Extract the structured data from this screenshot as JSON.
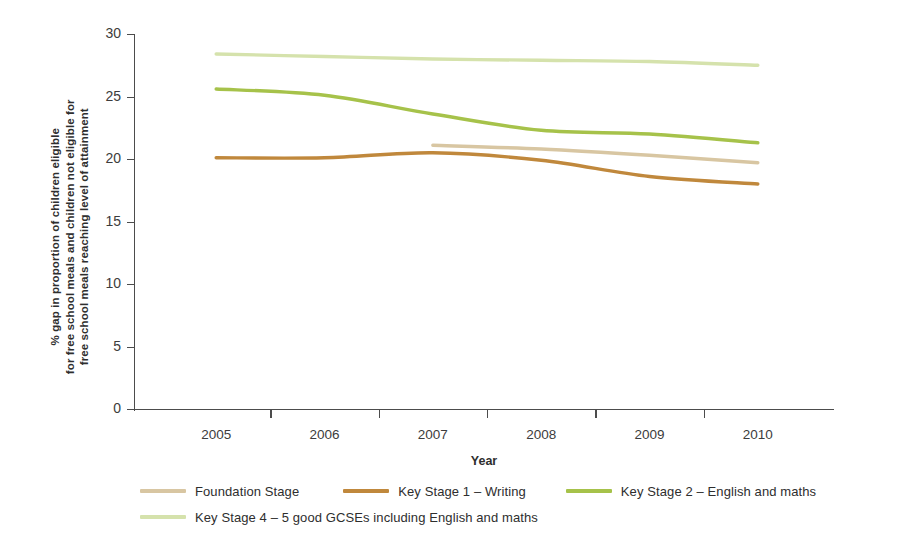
{
  "chart_data": {
    "type": "line",
    "title": "",
    "xlabel": "Year",
    "ylabel_lines": [
      "% gap in proportion of children eligible",
      "for free school meals and children not eligible for",
      "free school meals reaching level of attainment"
    ],
    "categories": [
      "2005",
      "2006",
      "2007",
      "2008",
      "2009",
      "2010"
    ],
    "x_tick_labels": [
      "2005",
      "2006",
      "2007",
      "2008",
      "2009",
      "2010"
    ],
    "y_tick_labels": [
      "0",
      "5",
      "10",
      "15",
      "20",
      "25",
      "30"
    ],
    "y_ticks": [
      0,
      5,
      10,
      15,
      20,
      25,
      30
    ],
    "ylim": [
      0,
      30
    ],
    "grid": false,
    "legend_position": "bottom-left",
    "series": [
      {
        "name": "Foundation Stage",
        "color": "#d8c6a2",
        "x": [
          "2007",
          "2008",
          "2009",
          "2010"
        ],
        "values": [
          21.1,
          20.8,
          20.3,
          19.7
        ]
      },
      {
        "name": "Key Stage 1 – Writing",
        "color": "#c0883c",
        "x": [
          "2005",
          "2006",
          "2007",
          "2008",
          "2009",
          "2010"
        ],
        "values": [
          20.1,
          20.1,
          20.5,
          19.9,
          18.6,
          18.0
        ]
      },
      {
        "name": "Key Stage 2 – English and maths",
        "color": "#a6c24a",
        "x": [
          "2005",
          "2006",
          "2007",
          "2008",
          "2009",
          "2010"
        ],
        "values": [
          25.6,
          25.1,
          23.6,
          22.3,
          22.0,
          21.3
        ]
      },
      {
        "name": "Key Stage 4 – 5 good GCSEs including English and maths",
        "color": "#d5e2ac",
        "x": [
          "2005",
          "2006",
          "2007",
          "2008",
          "2009",
          "2010"
        ],
        "values": [
          28.4,
          28.2,
          28.0,
          27.9,
          27.8,
          27.5
        ]
      }
    ]
  },
  "legend": {
    "rows": [
      [
        {
          "label": "Foundation Stage",
          "color": "#d8c6a2"
        },
        {
          "label": "Key Stage 1 – Writing",
          "color": "#c0883c"
        },
        {
          "label": "Key Stage 2 – English and maths",
          "color": "#a6c24a"
        }
      ],
      [
        {
          "label": "Key Stage 4 – 5 good GCSEs including English and maths",
          "color": "#d5e2ac"
        }
      ]
    ]
  }
}
